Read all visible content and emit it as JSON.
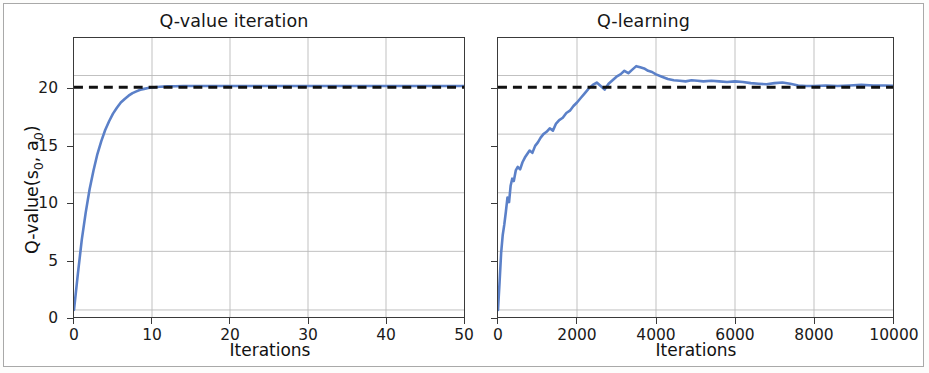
{
  "figure": {
    "background_color": "#ffffff",
    "border_color": "#a9a9a9",
    "series_color": "#5b80c8",
    "reference_color": "#111111",
    "grid_color": "#b9b9b9",
    "axis_color": "#3a3a3a"
  },
  "panels": [
    {
      "title": "Q-value iteration",
      "xlabel": "Iterations",
      "ylabel_html": "Q-value(s<sub>0</sub>, a<sub>0</sub>)",
      "xticks": [
        "0",
        "10",
        "20",
        "30",
        "40",
        "50"
      ],
      "yticks": [
        "0",
        "5",
        "10",
        "15",
        "20"
      ],
      "reference_label": "19.0"
    },
    {
      "title": "Q-learning",
      "xlabel": "Iterations",
      "ylabel_html": "",
      "xticks": [
        "0",
        "2000",
        "4000",
        "6000",
        "8000",
        "10000"
      ],
      "yticks": [
        "",
        "",
        "",
        "",
        ""
      ],
      "reference_label": "19.0"
    }
  ],
  "chart_data": [
    {
      "type": "line",
      "title": "Q-value iteration",
      "xlabel": "Iterations",
      "ylabel": "Q-value(s0, a0)",
      "xlim": [
        0,
        50
      ],
      "ylim": [
        -0.6,
        23.2
      ],
      "xticks": [
        0,
        10,
        20,
        30,
        40,
        50
      ],
      "yticks": [
        0,
        5,
        10,
        15,
        20
      ],
      "grid": true,
      "legend": "none",
      "reference_line": {
        "y": 19.0,
        "style": "dashed",
        "color": "#111111"
      },
      "series": [
        {
          "name": "Q-value iteration estimate",
          "color": "#5b80c8",
          "x": [
            0,
            0.5,
            1,
            1.5,
            2,
            2.5,
            3,
            3.5,
            4,
            4.5,
            5,
            5.5,
            6,
            6.5,
            7,
            7.5,
            8,
            8.5,
            9,
            9.5,
            10,
            11,
            12,
            13,
            14,
            15,
            17.5,
            20,
            25,
            30,
            35,
            40,
            45,
            50
          ],
          "y": [
            0.0,
            3.1,
            6.0,
            8.3,
            10.3,
            11.9,
            13.3,
            14.4,
            15.35,
            16.1,
            16.75,
            17.25,
            17.7,
            18.0,
            18.28,
            18.5,
            18.65,
            18.78,
            18.86,
            18.93,
            18.98,
            19.04,
            19.07,
            19.09,
            19.1,
            19.1,
            19.11,
            19.11,
            19.11,
            19.11,
            19.11,
            19.11,
            19.11,
            19.11
          ]
        }
      ]
    },
    {
      "type": "line",
      "title": "Q-learning",
      "xlabel": "Iterations",
      "ylabel": "",
      "xlim": [
        0,
        10000
      ],
      "ylim": [
        -0.6,
        23.2
      ],
      "xticks": [
        0,
        2000,
        4000,
        6000,
        8000,
        10000
      ],
      "yticks": [
        0,
        5,
        10,
        15,
        20
      ],
      "grid": true,
      "legend": "none",
      "reference_line": {
        "y": 19.0,
        "style": "dashed",
        "color": "#111111"
      },
      "series": [
        {
          "name": "Q-learning estimate",
          "color": "#5b80c8",
          "x": [
            0,
            40,
            80,
            120,
            160,
            200,
            240,
            280,
            320,
            360,
            400,
            450,
            500,
            560,
            620,
            680,
            740,
            800,
            870,
            940,
            1010,
            1080,
            1150,
            1230,
            1310,
            1390,
            1470,
            1550,
            1640,
            1730,
            1820,
            1910,
            2000,
            2100,
            2200,
            2300,
            2400,
            2500,
            2600,
            2700,
            2800,
            2900,
            3000,
            3100,
            3200,
            3300,
            3400,
            3500,
            3600,
            3700,
            3800,
            3900,
            4000,
            4150,
            4300,
            4450,
            4600,
            4750,
            4900,
            5050,
            5200,
            5400,
            5600,
            5800,
            6000,
            6200,
            6400,
            6600,
            6800,
            7000,
            7200,
            7400,
            7600,
            7800,
            8000,
            8300,
            8600,
            8900,
            9200,
            9500,
            9800,
            10000
          ],
          "y": [
            0.0,
            2.4,
            4.9,
            6.4,
            7.3,
            8.4,
            9.6,
            9.2,
            10.6,
            11.2,
            11.0,
            11.9,
            12.2,
            12.0,
            12.6,
            13.0,
            13.3,
            13.6,
            13.4,
            14.0,
            14.3,
            14.7,
            15.0,
            15.2,
            15.5,
            15.3,
            15.9,
            16.2,
            16.4,
            16.8,
            17.0,
            17.4,
            17.7,
            18.1,
            18.5,
            18.9,
            19.2,
            19.4,
            19.1,
            18.8,
            19.3,
            19.6,
            19.9,
            20.1,
            20.4,
            20.2,
            20.5,
            20.8,
            20.7,
            20.6,
            20.4,
            20.3,
            20.1,
            19.9,
            19.7,
            19.6,
            19.55,
            19.5,
            19.6,
            19.55,
            19.5,
            19.55,
            19.5,
            19.45,
            19.5,
            19.45,
            19.35,
            19.3,
            19.25,
            19.35,
            19.4,
            19.3,
            19.15,
            19.1,
            19.1,
            19.15,
            19.1,
            19.15,
            19.2,
            19.15,
            19.15,
            19.12
          ]
        }
      ]
    }
  ]
}
